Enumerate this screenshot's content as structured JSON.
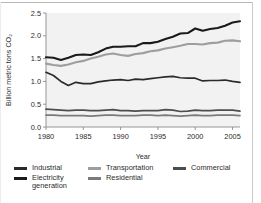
{
  "chart_data": {
    "type": "line",
    "title": "",
    "xlabel": "Year",
    "ylabel": "Billion metric tons CO₂",
    "xlim": [
      1980,
      2006
    ],
    "ylim": [
      0.0,
      2.5
    ],
    "xticks": [
      1980,
      1985,
      1990,
      1995,
      2000,
      2005
    ],
    "xticklabels": [
      "1980",
      "1985",
      "1990",
      "1995",
      "2000",
      "2005"
    ],
    "yticks": [
      0.0,
      0.5,
      1.0,
      1.5,
      2.0,
      2.5
    ],
    "yticklabels": [
      "0.0",
      "0.5",
      "1.0",
      "1.5",
      "2.0",
      "2.5"
    ],
    "grid": false,
    "legend_position": "below",
    "plot_background": "#f2f2f2",
    "x": [
      1980,
      1981,
      1982,
      1983,
      1984,
      1985,
      1986,
      1987,
      1988,
      1989,
      1990,
      1991,
      1992,
      1993,
      1994,
      1995,
      1996,
      1997,
      1998,
      1999,
      2000,
      2001,
      2002,
      2003,
      2004,
      2005,
      2006
    ],
    "series": [
      {
        "name": "Electricity generation",
        "color": "#1a1a1a",
        "width": 2.1,
        "values": [
          1.53,
          1.52,
          1.47,
          1.52,
          1.58,
          1.59,
          1.58,
          1.64,
          1.72,
          1.76,
          1.76,
          1.77,
          1.77,
          1.84,
          1.84,
          1.87,
          1.93,
          1.98,
          2.05,
          2.06,
          2.16,
          2.11,
          2.15,
          2.17,
          2.22,
          2.29,
          2.32
        ]
      },
      {
        "name": "Transportation",
        "color": "#9e9e9e",
        "width": 2.1,
        "values": [
          1.39,
          1.36,
          1.34,
          1.37,
          1.42,
          1.45,
          1.5,
          1.54,
          1.59,
          1.61,
          1.58,
          1.56,
          1.6,
          1.62,
          1.66,
          1.68,
          1.72,
          1.75,
          1.78,
          1.82,
          1.82,
          1.81,
          1.84,
          1.85,
          1.89,
          1.9,
          1.88
        ]
      },
      {
        "name": "Industrial",
        "color": "#2b2b2b",
        "width": 1.7,
        "values": [
          1.2,
          1.13,
          1.0,
          0.91,
          0.98,
          0.95,
          0.95,
          0.99,
          1.01,
          1.03,
          1.04,
          1.02,
          1.05,
          1.04,
          1.06,
          1.08,
          1.1,
          1.11,
          1.08,
          1.07,
          1.07,
          1.01,
          1.02,
          1.02,
          1.03,
          1.0,
          0.98
        ]
      },
      {
        "name": "Commercial",
        "color": "#4d4d4d",
        "width": 1.7,
        "values": [
          0.39,
          0.38,
          0.37,
          0.36,
          0.37,
          0.37,
          0.36,
          0.36,
          0.37,
          0.38,
          0.36,
          0.36,
          0.35,
          0.36,
          0.36,
          0.36,
          0.38,
          0.37,
          0.34,
          0.35,
          0.37,
          0.36,
          0.36,
          0.37,
          0.37,
          0.37,
          0.35
        ]
      },
      {
        "name": "Residential",
        "color": "#7a7a7a",
        "width": 1.7,
        "values": [
          0.26,
          0.26,
          0.25,
          0.25,
          0.25,
          0.25,
          0.24,
          0.25,
          0.26,
          0.26,
          0.25,
          0.25,
          0.25,
          0.26,
          0.26,
          0.25,
          0.26,
          0.25,
          0.24,
          0.25,
          0.26,
          0.25,
          0.25,
          0.26,
          0.26,
          0.26,
          0.25
        ]
      }
    ]
  },
  "legend": {
    "rows": [
      [
        {
          "label": "Industrial",
          "color": "#2b2b2b"
        },
        {
          "label": "Transportation",
          "color": "#9e9e9e"
        },
        {
          "label": "Commercial",
          "color": "#4d4d4d"
        }
      ],
      [
        {
          "label": "Electricity generation",
          "color": "#1a1a1a"
        },
        {
          "label": "Residential",
          "color": "#7a7a7a"
        }
      ]
    ]
  }
}
